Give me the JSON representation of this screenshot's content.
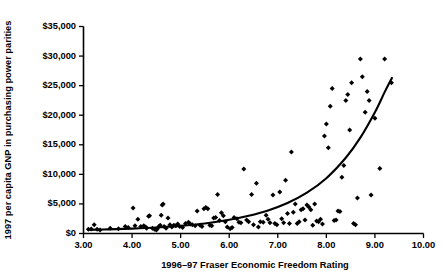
{
  "chart_data": {
    "type": "scatter",
    "title": "",
    "xlabel": "1996–97 Fraser Economic Freedom Rating",
    "ylabel": "1997 per capita GNP in purchasing power parities",
    "xlim": [
      3.0,
      10.0
    ],
    "ylim": [
      0,
      35000
    ],
    "xticks": [
      3.0,
      4.0,
      5.0,
      6.0,
      7.0,
      8.0,
      9.0,
      10.0
    ],
    "xtick_labels": [
      "3.00",
      "4.00",
      "5.00",
      "6.00",
      "7.00",
      "8.00",
      "9.00",
      "10.00"
    ],
    "yticks": [
      0,
      5000,
      10000,
      15000,
      20000,
      25000,
      30000,
      35000
    ],
    "ytick_labels": [
      "$0",
      "$5,000",
      "$10,000",
      "$15,000",
      "$20,000",
      "$25,000",
      "$30,000",
      "$35,000"
    ],
    "grid": false,
    "legend": null,
    "marker": "diamond",
    "marker_color": "#000000",
    "curve_color": "#000000",
    "points": [
      [
        3.1,
        700
      ],
      [
        3.16,
        750
      ],
      [
        3.22,
        1500
      ],
      [
        3.28,
        700
      ],
      [
        3.34,
        600
      ],
      [
        3.55,
        900
      ],
      [
        3.72,
        800
      ],
      [
        3.86,
        1200
      ],
      [
        3.92,
        1000
      ],
      [
        4.02,
        4300
      ],
      [
        4.06,
        1300
      ],
      [
        4.12,
        2400
      ],
      [
        4.18,
        1200
      ],
      [
        4.24,
        1300
      ],
      [
        4.28,
        1100
      ],
      [
        4.3,
        900
      ],
      [
        4.34,
        2900
      ],
      [
        4.36,
        3000
      ],
      [
        4.42,
        900
      ],
      [
        4.46,
        700
      ],
      [
        4.5,
        600
      ],
      [
        4.52,
        800
      ],
      [
        4.55,
        1200
      ],
      [
        4.58,
        1400
      ],
      [
        4.6,
        3100
      ],
      [
        4.62,
        4800
      ],
      [
        4.64,
        5000
      ],
      [
        4.66,
        1200
      ],
      [
        4.7,
        900
      ],
      [
        4.74,
        2600
      ],
      [
        4.78,
        1500
      ],
      [
        4.82,
        1100
      ],
      [
        4.86,
        1400
      ],
      [
        4.9,
        1300
      ],
      [
        4.94,
        1600
      ],
      [
        4.98,
        1200
      ],
      [
        5.04,
        1000
      ],
      [
        5.1,
        1700
      ],
      [
        5.16,
        1900
      ],
      [
        5.2,
        1600
      ],
      [
        5.24,
        1500
      ],
      [
        5.3,
        1300
      ],
      [
        5.34,
        3800
      ],
      [
        5.4,
        1400
      ],
      [
        5.44,
        1200
      ],
      [
        5.48,
        4200
      ],
      [
        5.52,
        4400
      ],
      [
        5.56,
        4200
      ],
      [
        5.6,
        1400
      ],
      [
        5.64,
        1300
      ],
      [
        5.68,
        2600
      ],
      [
        5.72,
        2700
      ],
      [
        5.76,
        6600
      ],
      [
        5.8,
        2200
      ],
      [
        5.84,
        3500
      ],
      [
        5.88,
        3000
      ],
      [
        5.92,
        2000
      ],
      [
        5.96,
        1100
      ],
      [
        6.02,
        800
      ],
      [
        6.06,
        1000
      ],
      [
        6.1,
        2700
      ],
      [
        6.16,
        2500
      ],
      [
        6.2,
        1900
      ],
      [
        6.24,
        1800
      ],
      [
        6.3,
        10900
      ],
      [
        6.36,
        2300
      ],
      [
        6.4,
        2000
      ],
      [
        6.46,
        6600
      ],
      [
        6.5,
        1500
      ],
      [
        6.56,
        8500
      ],
      [
        6.6,
        1100
      ],
      [
        6.64,
        2000
      ],
      [
        6.7,
        1900
      ],
      [
        6.76,
        3100
      ],
      [
        6.8,
        2400
      ],
      [
        6.84,
        1800
      ],
      [
        6.9,
        6500
      ],
      [
        6.94,
        1700
      ],
      [
        6.98,
        1500
      ],
      [
        7.04,
        7000
      ],
      [
        7.08,
        2500
      ],
      [
        7.12,
        1800
      ],
      [
        7.16,
        9000
      ],
      [
        7.2,
        3400
      ],
      [
        7.24,
        1700
      ],
      [
        7.28,
        13800
      ],
      [
        7.32,
        3600
      ],
      [
        7.36,
        5000
      ],
      [
        7.4,
        1700
      ],
      [
        7.44,
        2000
      ],
      [
        7.48,
        4000
      ],
      [
        7.52,
        4200
      ],
      [
        7.56,
        2300
      ],
      [
        7.6,
        4800
      ],
      [
        7.64,
        4500
      ],
      [
        7.68,
        4000
      ],
      [
        7.72,
        1400
      ],
      [
        7.76,
        5000
      ],
      [
        7.8,
        2100
      ],
      [
        7.84,
        2000
      ],
      [
        7.88,
        2400
      ],
      [
        7.92,
        1600
      ],
      [
        7.96,
        16500
      ],
      [
        8.0,
        18500
      ],
      [
        8.04,
        14500
      ],
      [
        8.08,
        21500
      ],
      [
        8.12,
        24500
      ],
      [
        8.16,
        2200
      ],
      [
        8.2,
        2300
      ],
      [
        8.24,
        3800
      ],
      [
        8.28,
        3700
      ],
      [
        8.32,
        9500
      ],
      [
        8.36,
        11500
      ],
      [
        8.4,
        22500
      ],
      [
        8.44,
        23500
      ],
      [
        8.48,
        17500
      ],
      [
        8.52,
        25500
      ],
      [
        8.56,
        1700
      ],
      [
        8.6,
        1500
      ],
      [
        8.64,
        6000
      ],
      [
        8.7,
        29500
      ],
      [
        8.74,
        26500
      ],
      [
        8.8,
        20500
      ],
      [
        8.84,
        24000
      ],
      [
        8.88,
        22500
      ],
      [
        8.92,
        6500
      ],
      [
        9.0,
        19500
      ],
      [
        9.1,
        11000
      ],
      [
        9.2,
        29500
      ],
      [
        9.34,
        25500
      ]
    ],
    "fit_curve": {
      "description": "exponential trend line",
      "x_start": 3.1,
      "x_end": 9.35,
      "points": [
        [
          3.1,
          620
        ],
        [
          3.5,
          700
        ],
        [
          4.0,
          830
        ],
        [
          4.5,
          1010
        ],
        [
          5.0,
          1290
        ],
        [
          5.5,
          1700
        ],
        [
          6.0,
          2320
        ],
        [
          6.4,
          3000
        ],
        [
          6.8,
          3900
        ],
        [
          7.2,
          5150
        ],
        [
          7.6,
          6900
        ],
        [
          8.0,
          9350
        ],
        [
          8.4,
          12800
        ],
        [
          8.7,
          16200
        ],
        [
          9.0,
          20500
        ],
        [
          9.2,
          23900
        ],
        [
          9.35,
          26300
        ]
      ]
    }
  }
}
